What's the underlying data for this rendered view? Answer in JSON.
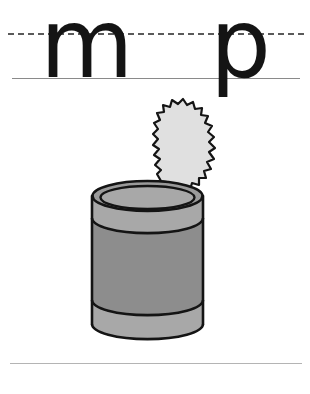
{
  "page": {
    "background_color": "#ffffff",
    "width": 310,
    "height": 394
  },
  "guide_lines": {
    "dashed_midline": {
      "label": "dashed x-height guide line",
      "color": "#5a5a5a",
      "style": "dashed"
    },
    "solid_baseline": {
      "label": "solid baseline guide line",
      "color": "#8a8a8a",
      "style": "solid"
    },
    "footer_rule": {
      "label": "bottom horizontal rule",
      "color": "#b4b4b4",
      "style": "solid"
    }
  },
  "letters": [
    {
      "char": "m",
      "name": "letter-m",
      "color": "#141414"
    },
    {
      "char": "p",
      "name": "letter-p",
      "color": "#141414"
    }
  ],
  "illustration": {
    "name": "tin-can",
    "description": "opened tin can with serrated lid",
    "colors": {
      "outline": "#141414",
      "body_gray": "#8d8d8d",
      "rim_gray": "#a8a8a8",
      "lid_gray": "#e0e0e0",
      "inner_gray": "#9a9a9a"
    }
  }
}
